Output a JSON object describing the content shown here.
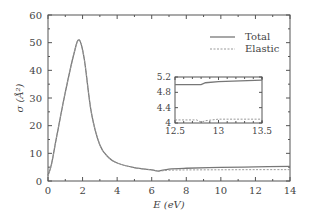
{
  "chart_data": {
    "type": "line",
    "title": "",
    "xlabel": "E (eV)",
    "ylabel": "σ (Å²)",
    "xlim": [
      0,
      14
    ],
    "ylim": [
      0,
      60
    ],
    "xticks": [
      0,
      2,
      4,
      6,
      8,
      10,
      12,
      14
    ],
    "yticks": [
      0,
      10,
      20,
      30,
      40,
      50,
      60
    ],
    "legend": {
      "position": "upper right",
      "entries": [
        "Total",
        "Elastic"
      ]
    },
    "series": [
      {
        "name": "Total",
        "style": "solid",
        "x": [
          0,
          0.2,
          0.5,
          1.0,
          1.5,
          1.8,
          2.1,
          2.5,
          3.0,
          3.5,
          4.0,
          5.0,
          6.0,
          6.4,
          7,
          8,
          10,
          12,
          14
        ],
        "y": [
          2,
          6,
          16,
          32,
          46,
          51,
          44,
          25,
          13,
          8.5,
          6.5,
          4.8,
          4.0,
          3.6,
          4.3,
          4.6,
          4.9,
          5.1,
          5.3
        ]
      },
      {
        "name": "Elastic",
        "style": "dashed",
        "x": [
          0,
          0.2,
          0.5,
          1.0,
          1.5,
          1.8,
          2.1,
          2.5,
          3.0,
          3.5,
          4.0,
          5.0,
          6.0,
          6.4,
          7,
          8,
          10,
          12,
          14
        ],
        "y": [
          2,
          6,
          16,
          32,
          46,
          51,
          44,
          25,
          13,
          8.5,
          6.5,
          4.8,
          4.0,
          3.6,
          3.9,
          4.0,
          4.05,
          4.1,
          4.1
        ]
      }
    ],
    "inset": {
      "xlim": [
        12.5,
        13.5
      ],
      "ylim": [
        4,
        5.2
      ],
      "xticks": [
        12.5,
        13,
        13.5
      ],
      "yticks": [
        4,
        4.4,
        4.8,
        5.2
      ],
      "series": [
        {
          "name": "Total",
          "x": [
            12.5,
            12.8,
            12.85,
            13.0,
            13.5
          ],
          "y": [
            5.0,
            5.0,
            5.05,
            5.08,
            5.12
          ]
        },
        {
          "name": "Elastic",
          "x": [
            12.5,
            12.75,
            12.8,
            12.85,
            13.0,
            13.5
          ],
          "y": [
            4.08,
            4.08,
            4.02,
            4.06,
            4.1,
            4.1
          ]
        }
      ]
    }
  }
}
